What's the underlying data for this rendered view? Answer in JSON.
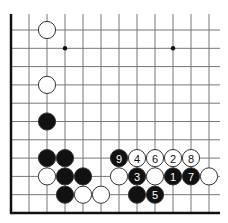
{
  "board": {
    "grid": {
      "origin_x": 11,
      "origin_y": 30,
      "spacing_x": 18,
      "spacing_y": 18.3,
      "columns": 12,
      "rows": 10,
      "line_top": 14,
      "line_right": 220,
      "line_color": "#777777",
      "edge_color": "#111111",
      "left_edge": true,
      "bottom_edge": true
    },
    "hoshi": [
      {
        "col": 3,
        "row": 1
      },
      {
        "col": 9,
        "row": 1
      }
    ],
    "stone_radius": 8.6,
    "colors": {
      "black": "#111111",
      "white": "#ffffff",
      "stone_outline": "#333333",
      "label_on_black": "#ffffff",
      "label_on_white": "#111111"
    },
    "stones": [
      {
        "color": "white",
        "col": 2,
        "row": 0,
        "label": ""
      },
      {
        "color": "white",
        "col": 2,
        "row": 3,
        "label": ""
      },
      {
        "color": "black",
        "col": 2,
        "row": 5,
        "label": ""
      },
      {
        "color": "black",
        "col": 2,
        "row": 7,
        "label": ""
      },
      {
        "color": "black",
        "col": 3,
        "row": 7,
        "label": ""
      },
      {
        "color": "white",
        "col": 2,
        "row": 8,
        "label": ""
      },
      {
        "color": "black",
        "col": 3,
        "row": 8,
        "label": ""
      },
      {
        "color": "black",
        "col": 4,
        "row": 8,
        "label": ""
      },
      {
        "color": "black",
        "col": 3,
        "row": 9,
        "label": ""
      },
      {
        "color": "white",
        "col": 4,
        "row": 9,
        "label": ""
      },
      {
        "color": "white",
        "col": 5,
        "row": 9,
        "label": ""
      },
      {
        "color": "black",
        "col": 6,
        "row": 7,
        "label": "9"
      },
      {
        "color": "white",
        "col": 7,
        "row": 7,
        "label": "4"
      },
      {
        "color": "white",
        "col": 8,
        "row": 7,
        "label": "6"
      },
      {
        "color": "white",
        "col": 9,
        "row": 7,
        "label": "2"
      },
      {
        "color": "white",
        "col": 10,
        "row": 7,
        "label": "8"
      },
      {
        "color": "white",
        "col": 6,
        "row": 8,
        "label": ""
      },
      {
        "color": "black",
        "col": 7,
        "row": 8,
        "label": "3"
      },
      {
        "color": "white",
        "col": 8,
        "row": 8,
        "label": ""
      },
      {
        "color": "black",
        "col": 9,
        "row": 8,
        "label": "1"
      },
      {
        "color": "black",
        "col": 10,
        "row": 8,
        "label": "7"
      },
      {
        "color": "white",
        "col": 11,
        "row": 8,
        "label": ""
      },
      {
        "color": "black",
        "col": 7,
        "row": 9,
        "label": ""
      },
      {
        "color": "black",
        "col": 8,
        "row": 9,
        "label": "5"
      }
    ]
  }
}
